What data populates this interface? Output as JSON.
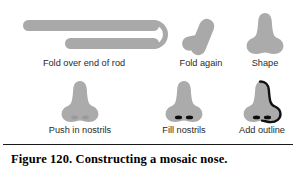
{
  "figure": {
    "caption": "Figure 120.  Constructing a mosaic nose.",
    "colors": {
      "clay": "#a9a9a9",
      "nose_fill": "#ababab",
      "nostril": "#0d0d0d",
      "outline": "#111111",
      "border": "#1a1a1a",
      "background": "#ffffff",
      "label_text": "#2a2a2a"
    },
    "steps": [
      {
        "id": "fold-over-end-of-rod",
        "label": "Fold over end of rod",
        "art": "rod-folded-hairpin"
      },
      {
        "id": "fold-again",
        "label": "Fold again",
        "art": "two-rounded-clay-pieces"
      },
      {
        "id": "shape",
        "label": "Shape",
        "art": "nose-silhouette"
      },
      {
        "id": "push-in-nostrils",
        "label": "Push in nostrils",
        "art": "nose-silhouette-with-indents"
      },
      {
        "id": "fill-nostrils",
        "label": "Fill nostrils",
        "art": "nose-silhouette-with-black-nostrils"
      },
      {
        "id": "add-outline",
        "label": "Add outline",
        "art": "nose-silhouette-outlined"
      }
    ]
  }
}
